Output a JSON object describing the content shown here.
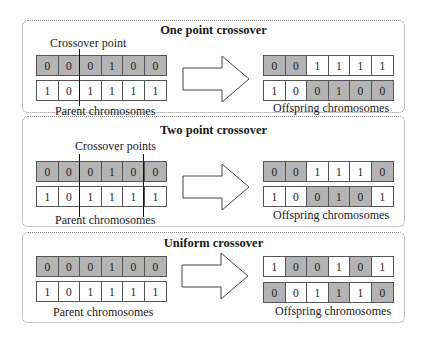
{
  "colors": {
    "shaded": "#b4b4b4",
    "plain": "#ffffff",
    "border": "#555555"
  },
  "panels": [
    {
      "title": "One point crossover",
      "annotation": "Crossover point",
      "parent_caption": "Parent chromosomes",
      "offspring_caption": "Offspring chromosomes",
      "crossover_after_genes": [
        2
      ],
      "parents": [
        {
          "genes": [
            "0",
            "0",
            "0",
            "1",
            "0",
            "0"
          ],
          "shaded": [
            true,
            true,
            true,
            true,
            true,
            true
          ]
        },
        {
          "genes": [
            "1",
            "0",
            "1",
            "1",
            "1",
            "1"
          ],
          "shaded": [
            false,
            false,
            false,
            false,
            false,
            false
          ]
        }
      ],
      "offspring": [
        {
          "genes": [
            "0",
            "0",
            "1",
            "1",
            "1",
            "1"
          ],
          "shaded": [
            true,
            true,
            false,
            false,
            false,
            false
          ]
        },
        {
          "genes": [
            "1",
            "0",
            "0",
            "1",
            "0",
            "0"
          ],
          "shaded": [
            false,
            false,
            true,
            true,
            true,
            true
          ]
        }
      ]
    },
    {
      "title": "Two point crossover",
      "annotation": "Crossover points",
      "parent_caption": "Parent chromosomes",
      "offspring_caption": "Offspring chromosomes",
      "crossover_after_genes": [
        2,
        5
      ],
      "parents": [
        {
          "genes": [
            "0",
            "0",
            "0",
            "1",
            "0",
            "0"
          ],
          "shaded": [
            true,
            true,
            true,
            true,
            true,
            true
          ]
        },
        {
          "genes": [
            "1",
            "0",
            "1",
            "1",
            "1",
            "1"
          ],
          "shaded": [
            false,
            false,
            false,
            false,
            false,
            false
          ]
        }
      ],
      "offspring": [
        {
          "genes": [
            "0",
            "0",
            "1",
            "1",
            "1",
            "0"
          ],
          "shaded": [
            true,
            true,
            false,
            false,
            false,
            true
          ]
        },
        {
          "genes": [
            "1",
            "0",
            "0",
            "1",
            "0",
            "1"
          ],
          "shaded": [
            false,
            false,
            true,
            true,
            true,
            false
          ]
        }
      ]
    },
    {
      "title": "Uniform crossover",
      "parent_caption": "Parent chromosomes",
      "offspring_caption": "Offspring chromosomes",
      "parents": [
        {
          "genes": [
            "0",
            "0",
            "0",
            "1",
            "0",
            "0"
          ],
          "shaded": [
            true,
            true,
            true,
            true,
            true,
            true
          ]
        },
        {
          "genes": [
            "1",
            "0",
            "1",
            "1",
            "1",
            "1"
          ],
          "shaded": [
            false,
            false,
            false,
            false,
            false,
            false
          ]
        }
      ],
      "offspring": [
        {
          "genes": [
            "1",
            "0",
            "0",
            "1",
            "0",
            "1"
          ],
          "shaded": [
            false,
            true,
            true,
            false,
            true,
            false
          ]
        },
        {
          "genes": [
            "0",
            "0",
            "1",
            "1",
            "1",
            "0"
          ],
          "shaded": [
            true,
            false,
            false,
            true,
            false,
            true
          ]
        }
      ]
    }
  ]
}
